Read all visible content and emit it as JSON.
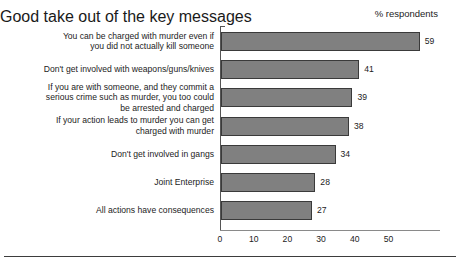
{
  "header": {
    "title": "Good take out of the key messages",
    "units_label": "% respondents"
  },
  "chart_data": {
    "type": "bar",
    "orientation": "horizontal",
    "title": "Good take out of the key messages",
    "xlabel": "% respondents",
    "ylabel": "",
    "xlim": [
      0,
      65
    ],
    "xticks": [
      0,
      10,
      20,
      30,
      40,
      50
    ],
    "grid": false,
    "legend": false,
    "bar_color": "#808080",
    "bar_edge_color": "#3a3a3a",
    "categories": [
      "You can be charged with murder even if you did not actually kill someone",
      "Don't get involved with weapons/guns/knives",
      "If you are with someone, and they commit a serious crime such as murder, you too could be arrested and charged",
      "If your action leads to murder you can get charged with murder",
      "Don't get involved in gangs",
      "Joint Enterprise",
      "All actions have consequences"
    ],
    "values": [
      59,
      41,
      39,
      38,
      34,
      28,
      27
    ]
  },
  "bars": [
    {
      "label_lines": [
        "You can be charged with murder even if",
        "you did not actually kill someone"
      ],
      "value": 59,
      "value_text": "59"
    },
    {
      "label_lines": [
        "Don't get involved with weapons/guns/knives"
      ],
      "value": 41,
      "value_text": "41"
    },
    {
      "label_lines": [
        "If you are with someone, and they commit a",
        "serious crime such as murder, you too could",
        "be arrested and charged"
      ],
      "value": 39,
      "value_text": "39"
    },
    {
      "label_lines": [
        "If your action leads to murder you can get",
        "charged with murder"
      ],
      "value": 38,
      "value_text": "38"
    },
    {
      "label_lines": [
        "Don't get involved in gangs"
      ],
      "value": 34,
      "value_text": "34"
    },
    {
      "label_lines": [
        "Joint Enterprise"
      ],
      "value": 28,
      "value_text": "28"
    },
    {
      "label_lines": [
        "All actions have consequences"
      ],
      "value": 27,
      "value_text": "27"
    }
  ],
  "xticks": [
    "0",
    "10",
    "20",
    "30",
    "40",
    "50"
  ]
}
